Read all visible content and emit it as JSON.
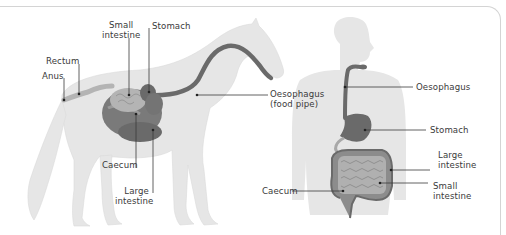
{
  "figure": {
    "panels": [
      {
        "id": "horse",
        "subject": "Horse digestive system",
        "labels": {
          "small_intestine_1": "Small",
          "small_intestine_2": "intestine",
          "stomach": "Stomach",
          "rectum": "Rectum",
          "anus": "Anus",
          "oesophagus_1": "Oesophagus",
          "oesophagus_2": "(food pipe)",
          "caecum": "Caecum",
          "large_intestine_1": "Large",
          "large_intestine_2": "intestine"
        }
      },
      {
        "id": "human",
        "subject": "Human digestive system",
        "labels": {
          "oesophagus": "Oesophagus",
          "stomach": "Stomach",
          "large_intestine_1": "Large",
          "large_intestine_2": "intestine",
          "caecum": "Caecum",
          "small_intestine_1": "Small",
          "small_intestine_2": "intestine"
        }
      }
    ],
    "colors": {
      "body_silhouette": "#e6e6e6",
      "organ_dark": "#6a6a6a",
      "organ_mid": "#8c8c8c",
      "organ_light": "#b4b4b4",
      "leader_line": "#3a3a3a",
      "frame": "#d4d4d4"
    }
  }
}
